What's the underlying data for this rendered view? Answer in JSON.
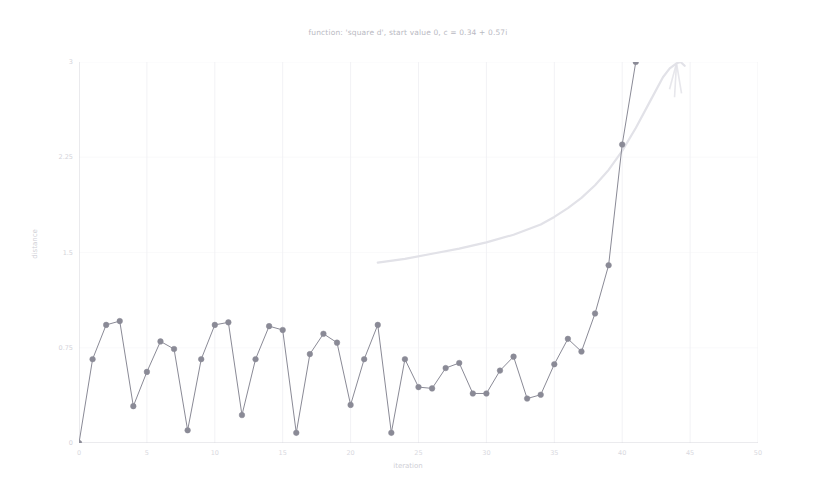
{
  "chart_data": {
    "type": "line",
    "title": "function: 'square d', start value 0, c = 0.34 + 0.57i",
    "xlabel": "iteration",
    "ylabel": "distance",
    "xlim": [
      0,
      50
    ],
    "ylim": [
      0,
      3
    ],
    "xticks": [
      "0",
      "5",
      "10",
      "15",
      "20",
      "25",
      "30",
      "35",
      "40",
      "45",
      "50"
    ],
    "xtick_values": [
      0,
      5,
      10,
      15,
      20,
      25,
      30,
      35,
      40,
      45,
      50
    ],
    "yticks": [
      "0",
      "0.75",
      "1.5",
      "2.25",
      "3"
    ],
    "ytick_values": [
      0,
      0.75,
      1.5,
      2.25,
      3
    ],
    "grid": true,
    "legend": "none",
    "series": [
      {
        "name": "distance",
        "color": "#8a8a96",
        "marker": "circle",
        "x": [
          0,
          1,
          2,
          3,
          4,
          5,
          6,
          7,
          8,
          9,
          10,
          11,
          12,
          13,
          14,
          15,
          16,
          17,
          18,
          19,
          20,
          21,
          22,
          23,
          24,
          25,
          26,
          27,
          28,
          29,
          30,
          31,
          32,
          33,
          34,
          35,
          36,
          37,
          38,
          39,
          40,
          41,
          42,
          43,
          44,
          45,
          46,
          47
        ],
        "y": [
          0.0,
          0.66,
          0.93,
          0.96,
          0.29,
          0.56,
          0.8,
          0.74,
          0.1,
          0.66,
          0.93,
          0.95,
          0.22,
          0.66,
          0.92,
          0.89,
          0.08,
          0.7,
          0.86,
          0.79,
          0.3,
          0.66,
          0.93,
          0.08,
          0.66,
          0.44,
          0.43,
          0.59,
          0.63,
          0.39,
          0.39,
          0.57,
          0.68,
          0.35,
          0.38,
          0.62,
          0.82,
          0.72,
          1.02,
          1.4,
          2.35,
          3.0,
          8.2,
          62.0,
          3700.0,
          13600000.0,
          190000000000000.0,
          3.6e+28
        ]
      },
      {
        "name": "divergence-envelope",
        "color": "#e2e2e8",
        "marker": "none",
        "x": [
          22,
          24,
          26,
          28,
          30,
          32,
          34,
          35,
          36,
          37,
          38,
          39,
          40,
          41,
          42,
          43,
          43.5,
          44,
          44.3,
          44.6
        ],
        "y": [
          1.42,
          1.45,
          1.49,
          1.53,
          1.58,
          1.64,
          1.72,
          1.78,
          1.85,
          1.93,
          2.03,
          2.15,
          2.3,
          2.48,
          2.68,
          2.88,
          2.95,
          2.99,
          3.0,
          2.97
        ]
      }
    ]
  },
  "colors": {
    "main_series": "#8a8a96",
    "faint_series": "#e4e4ea",
    "axis": "#d6d6dc",
    "grid": "#f2f2f5",
    "title_text": "#b9b9c2",
    "tick_text": "#d6d6dd",
    "background": "#ffffff"
  }
}
